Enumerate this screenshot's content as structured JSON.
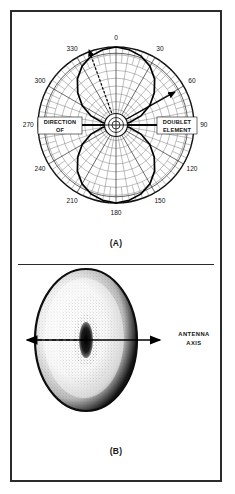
{
  "figure": {
    "panels": [
      {
        "id": "A",
        "caption": "(A)",
        "type": "polar",
        "annotations": {
          "left_line1": "DIRECTION",
          "left_line2": "OF",
          "right_line1": "DOUBLET",
          "right_line2": "ELEMENT"
        }
      },
      {
        "id": "B",
        "caption": "(B)",
        "type": "solid-of-revolution",
        "annotations": {
          "axis_line1": "ANTENNA",
          "axis_line2": "AXIS"
        }
      }
    ]
  },
  "chart_data": {
    "type": "line",
    "projection": "polar",
    "xlabel": "Azimuth angle (degrees)",
    "ylabel": "Relative field strength",
    "grid": true,
    "legend": null,
    "angle_unit": "degrees",
    "theta_ticks": [
      0,
      30,
      60,
      90,
      120,
      150,
      180,
      210,
      240,
      270,
      300,
      330
    ],
    "theta_tick_labels": [
      "0",
      "30",
      "60",
      "90",
      "120",
      "150",
      "180",
      "210",
      "240",
      "270",
      "300",
      "330"
    ],
    "theta_minor_step": 10,
    "rlim": [
      0,
      1
    ],
    "r_rings": [
      0.1,
      0.2,
      0.3,
      0.4,
      0.5,
      0.6,
      0.7,
      0.8,
      0.9,
      1.0
    ],
    "series": [
      {
        "name": "Doublet (dipole) pattern",
        "formula": "r = |cos(theta)| normalized with maxima at 0 and 180 degrees",
        "theta": [
          0,
          10,
          20,
          30,
          40,
          50,
          60,
          70,
          80,
          90,
          100,
          110,
          120,
          130,
          140,
          150,
          160,
          170,
          180,
          190,
          200,
          210,
          220,
          230,
          240,
          250,
          260,
          270,
          280,
          290,
          300,
          310,
          320,
          330,
          340,
          350,
          360
        ],
        "r": [
          1.0,
          0.98,
          0.94,
          0.87,
          0.77,
          0.64,
          0.5,
          0.34,
          0.17,
          0.0,
          0.17,
          0.34,
          0.5,
          0.64,
          0.77,
          0.87,
          0.94,
          0.98,
          1.0,
          0.98,
          0.94,
          0.87,
          0.77,
          0.64,
          0.5,
          0.34,
          0.17,
          0.0,
          0.17,
          0.34,
          0.5,
          0.64,
          0.77,
          0.87,
          0.94,
          0.98,
          1.0
        ]
      }
    ],
    "markers": [
      {
        "name": "direction-of-arrow",
        "angle_deg": 270,
        "label": "DIRECTION OF"
      },
      {
        "name": "doublet-element-arrow",
        "angle_deg": 90,
        "label": "DOUBLET ELEMENT"
      },
      {
        "name": "radial-dashed-arrow-upper-left",
        "angle_deg": 340
      },
      {
        "name": "radial-arrow-upper-right",
        "angle_deg": 48
      }
    ]
  }
}
